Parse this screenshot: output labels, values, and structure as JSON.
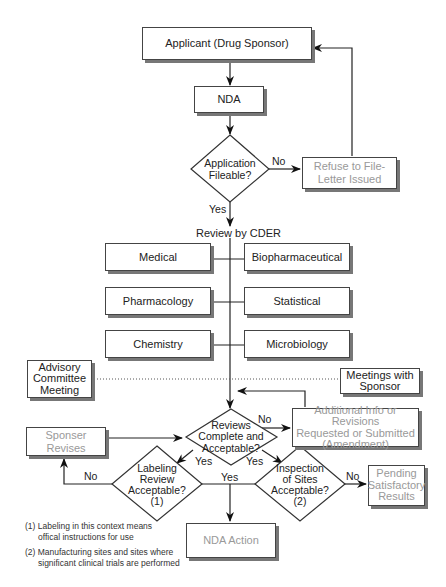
{
  "diagram": {
    "nodes": {
      "applicant": "Applicant (Drug Sponsor)",
      "nda": "NDA",
      "application_fileable": [
        "Application",
        "Fileable?"
      ],
      "refuse_to_file": [
        "Refuse to File-",
        "Letter Issued"
      ],
      "review_by_cder": "Review by CDER",
      "medical": "Medical",
      "biopharmaceutical": "Biopharmaceutical",
      "pharmacology": "Pharmacology",
      "statistical": "Statistical",
      "chemistry": "Chemistry",
      "microbiology": "Microbiology",
      "advisory_committee": [
        "Advisory",
        "Committee",
        "Meeting"
      ],
      "meetings_with_sponsor": [
        "Meetings with",
        "Sponsor"
      ],
      "reviews_complete": [
        "Reviews",
        "Complete and",
        "Acceptable?"
      ],
      "additional_info": [
        "Additional Info or Revisions",
        "Requested or Submitted",
        "(Amendment)"
      ],
      "sponser_revises": "Sponser Revises",
      "labeling_review": [
        "Labeling",
        "Review",
        "Acceptable?",
        "(1)"
      ],
      "inspection_of_sites": [
        "Inspection",
        "of Sites",
        "Acceptable?",
        "(2)"
      ],
      "pending_results": [
        "Pending",
        "Satisfactory",
        "Results"
      ],
      "nda_action": "NDA Action"
    },
    "edge_labels": {
      "fileable_no": "No",
      "fileable_yes": "Yes",
      "reviews_no": "No",
      "reviews_yes_left": "Yes",
      "reviews_yes_right": "Yes",
      "labeling_no": "No",
      "both_yes": "Yes",
      "inspection_no": "No"
    },
    "footnotes": {
      "note1_line1": "(1) Labeling in this context means",
      "note1_line2": "offical instructions for use",
      "note2_line1": "(2) Manufacturing sites and sites where",
      "note2_line2": "significant clinical trials are performed"
    }
  }
}
